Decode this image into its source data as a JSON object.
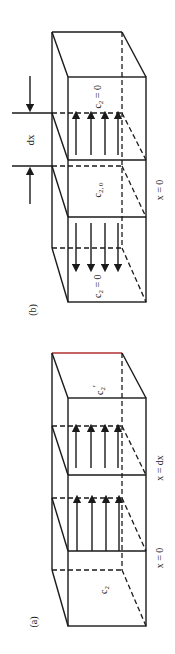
{
  "figure": {
    "orientation": "rotated 90 degrees counter-clockwise",
    "panels": [
      {
        "id": "a",
        "label": "(a)",
        "region_labels": {
          "left_concentration": "c",
          "left_concentration_sub": "2",
          "right_concentration": "c",
          "right_concentration_sub": "2",
          "right_concentration_prime": "′",
          "plane_left": "x = 0",
          "plane_right": "x = dx"
        },
        "flux_arrows": {
          "count": 4,
          "direction": "toward x = dx"
        }
      },
      {
        "id": "b",
        "label": "(b)",
        "region_labels": {
          "left_concentration": "c",
          "left_concentration_sub": "2",
          "left_concentration_eq": " = 0",
          "center_concentration": "c",
          "center_concentration_sub": "2, 0",
          "right_concentration": "c",
          "right_concentration_sub": "2",
          "right_concentration_eq": " = 0",
          "plane_label": "x = 0",
          "width_label": "dx"
        },
        "flux_arrows": [
          {
            "count": 4,
            "direction": "outward left"
          },
          {
            "count": 4,
            "direction": "outward right"
          }
        ]
      }
    ]
  },
  "colors": {
    "line": "#1a1a1a",
    "background": "#ffffff",
    "top_edge_tint": "#b03030"
  }
}
